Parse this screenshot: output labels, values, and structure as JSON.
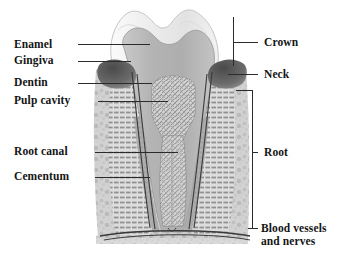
{
  "figure": {
    "background_color": "#ffffff",
    "text_color": "#141414",
    "leader_line_color": "#2b2b2b"
  },
  "labels_left": [
    {
      "id": "enamel",
      "text": "Enamel",
      "x": 14,
      "y": 38,
      "line_y": 44,
      "line_x1": 78,
      "line_x2": 150
    },
    {
      "id": "gingiva",
      "text": "Gingiva",
      "x": 14,
      "y": 54,
      "line_y": 61,
      "line_x1": 78,
      "line_x2": 131
    },
    {
      "id": "dentin",
      "text": "Dentin",
      "x": 14,
      "y": 76,
      "line_y": 83,
      "line_x1": 78,
      "line_x2": 152
    },
    {
      "id": "pulp-cavity",
      "text": "Pulp cavity",
      "x": 14,
      "y": 94,
      "line_y": 101,
      "line_x1": 98,
      "line_x2": 168
    },
    {
      "id": "root-canal",
      "text": "Root canal",
      "x": 14,
      "y": 145,
      "line_y": 152,
      "line_x1": 95,
      "line_x2": 178
    },
    {
      "id": "cementum",
      "text": "Cementum",
      "x": 14,
      "y": 170,
      "line_y": 177,
      "line_x1": 95,
      "line_x2": 150
    }
  ],
  "labels_right": [
    {
      "id": "crown",
      "text": "Crown",
      "x": 264,
      "y": 36,
      "tick_y": 42,
      "tick_x1": 233,
      "tick_x2": 258,
      "bracket": {
        "x": 233,
        "y1": 17,
        "y2": 66
      }
    },
    {
      "id": "neck",
      "text": "Neck",
      "x": 264,
      "y": 68,
      "tick_y": 74,
      "tick_x1": 228,
      "tick_x2": 258,
      "bracket": null
    },
    {
      "id": "root",
      "text": "Root",
      "x": 264,
      "y": 146,
      "tick_y": 152,
      "tick_x1": 252,
      "tick_x2": 258,
      "bracket": {
        "x": 252,
        "y1": 90,
        "y2": 228
      }
    },
    {
      "id": "blood-vessels-and-nerves",
      "text": "Blood vessels",
      "text_line2": "and nerves",
      "x": 261,
      "y": 222,
      "tick_y": 228,
      "tick_x1": 248,
      "tick_x2": 258,
      "bracket": null
    }
  ],
  "structures": [
    {
      "id": "enamel",
      "name": "Enamel",
      "color": "#e8e8e8"
    },
    {
      "id": "dentin",
      "name": "Dentin",
      "color": "#b9b9b9"
    },
    {
      "id": "pulp-cavity",
      "name": "Pulp cavity",
      "color": "#d2d2d2"
    },
    {
      "id": "root-canal",
      "name": "Root canal",
      "color": "#cfcfcf"
    },
    {
      "id": "cementum",
      "name": "Cementum",
      "color": "#a8a8a8"
    },
    {
      "id": "gingiva",
      "name": "Gingiva",
      "color": "#5a5a5a"
    },
    {
      "id": "alveolar-bone",
      "name": "Alveolar bone",
      "color": "#c6c6c6"
    },
    {
      "id": "periodontal",
      "name": "Periodontal ligament",
      "color": "#9a9a9a"
    },
    {
      "id": "blood-vessels",
      "name": "Blood vessels and nerves",
      "color": "#6f6f6f"
    }
  ]
}
